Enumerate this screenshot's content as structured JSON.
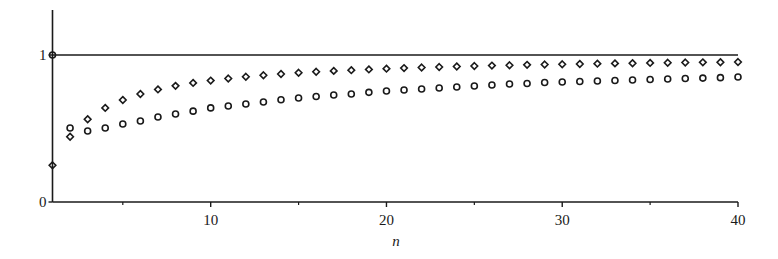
{
  "chart_data": {
    "type": "scatter",
    "title": "",
    "xlabel": "n",
    "ylabel": "",
    "xlim": [
      1,
      40
    ],
    "ylim": [
      0,
      1.3
    ],
    "grid": false,
    "legend": null,
    "x_ticks": [
      10,
      20,
      30,
      40
    ],
    "x_minor_ticks": [
      5,
      15,
      25,
      35
    ],
    "y_ticks": [
      0,
      1
    ],
    "reference_lines": [
      {
        "orientation": "horizontal",
        "y": 1
      }
    ],
    "x": [
      1,
      2,
      3,
      4,
      5,
      6,
      7,
      8,
      9,
      10,
      11,
      12,
      13,
      14,
      15,
      16,
      17,
      18,
      19,
      20,
      21,
      22,
      23,
      24,
      25,
      26,
      27,
      28,
      29,
      30,
      31,
      32,
      33,
      34,
      35,
      36,
      37,
      38,
      39,
      40
    ],
    "series": [
      {
        "name": "diamonds",
        "marker": "diamond",
        "values": [
          0.25,
          0.444,
          0.563,
          0.64,
          0.694,
          0.735,
          0.766,
          0.79,
          0.81,
          0.826,
          0.84,
          0.852,
          0.862,
          0.871,
          0.879,
          0.886,
          0.892,
          0.897,
          0.902,
          0.907,
          0.911,
          0.915,
          0.918,
          0.922,
          0.925,
          0.928,
          0.93,
          0.933,
          0.935,
          0.937,
          0.939,
          0.941,
          0.943,
          0.944,
          0.946,
          0.947,
          0.949,
          0.95,
          0.951,
          0.952
        ]
      },
      {
        "name": "circles",
        "marker": "circle",
        "values": [
          1.0,
          0.503,
          0.483,
          0.503,
          0.531,
          0.551,
          0.578,
          0.599,
          0.618,
          0.64,
          0.653,
          0.667,
          0.68,
          0.696,
          0.707,
          0.718,
          0.728,
          0.735,
          0.746,
          0.755,
          0.762,
          0.769,
          0.776,
          0.782,
          0.789,
          0.796,
          0.803,
          0.806,
          0.813,
          0.816,
          0.82,
          0.823,
          0.827,
          0.83,
          0.833,
          0.837,
          0.84,
          0.843,
          0.846,
          0.85
        ]
      }
    ]
  }
}
